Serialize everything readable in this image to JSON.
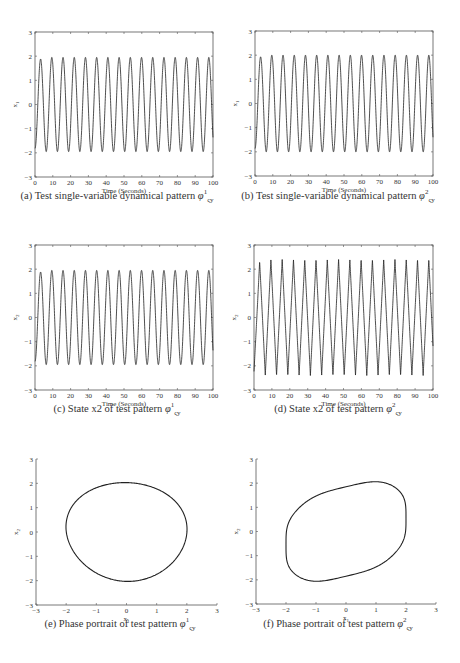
{
  "figure": {
    "panels": [
      {
        "id": "a",
        "caption_prefix": "(a) Test single-variable dynamical pattern ",
        "caption_symbol": "φ",
        "caption_sup": "1",
        "caption_sub": "ς",
        "caption_subsub": "y",
        "xlabel": "Time (Seconds)",
        "ylabel": "x1"
      },
      {
        "id": "b",
        "caption_prefix": "(b) Test single-variable dynamical pattern ",
        "caption_symbol": "φ",
        "caption_sup": "2",
        "caption_sub": "ς",
        "caption_subsub": "y",
        "xlabel": "Time (Seconds)",
        "ylabel": "x1"
      },
      {
        "id": "c",
        "caption_prefix": "(c) State x2 of test pattern ",
        "caption_symbol": "φ",
        "caption_sup": "1",
        "caption_sub": "ς",
        "caption_subsub": "y",
        "xlabel": "Time (Seconds)",
        "ylabel": "x2"
      },
      {
        "id": "d",
        "caption_prefix": "(d) State x2 of test pattern ",
        "caption_symbol": "φ",
        "caption_sup": "2",
        "caption_sub": "ς",
        "caption_subsub": "y",
        "xlabel": "Time (Seconds)",
        "ylabel": "x2"
      },
      {
        "id": "e",
        "caption_prefix": "(e) Phase portrait of test pattern ",
        "caption_symbol": "φ",
        "caption_sup": "1",
        "caption_sub": "ς",
        "caption_subsub": "y",
        "xlabel": "x1",
        "ylabel": "x2"
      },
      {
        "id": "f",
        "caption_prefix": "(f) Phase portrait of test pattern ",
        "caption_symbol": "φ",
        "caption_sup": "2",
        "caption_sub": "ς",
        "caption_subsub": "y",
        "xlabel": "x1",
        "ylabel": "x2"
      }
    ]
  },
  "chart_data": [
    {
      "type": "line",
      "title": "(a) Test single-variable dynamical pattern φ¹ςy",
      "xlabel": "Time (Seconds)",
      "ylabel": "x1",
      "xlim": [
        0,
        100
      ],
      "ylim": [
        -3,
        3
      ],
      "xticks": [
        0,
        10,
        20,
        30,
        40,
        50,
        60,
        70,
        80,
        90,
        100
      ],
      "yticks": [
        -3,
        -2,
        -1,
        0,
        1,
        2,
        3
      ],
      "series": [
        {
          "name": "x1",
          "description": "sinusoid-like oscillation",
          "amplitude": 1.95,
          "period": 6.3,
          "cycles_shown": 16,
          "shape": "sine"
        }
      ],
      "grid": false
    },
    {
      "type": "line",
      "title": "(b) Test single-variable dynamical pattern φ²ςy",
      "xlabel": "Time (Seconds)",
      "ylabel": "x1",
      "xlim": [
        0,
        100
      ],
      "ylim": [
        -3,
        3
      ],
      "xticks": [
        0,
        10,
        20,
        30,
        40,
        50,
        60,
        70,
        80,
        90,
        100
      ],
      "yticks": [
        -3,
        -2,
        -1,
        0,
        1,
        2,
        3
      ],
      "series": [
        {
          "name": "x1",
          "description": "sinusoid-like oscillation",
          "amplitude": 2.0,
          "period": 6.3,
          "cycles_shown": 16,
          "shape": "sine"
        }
      ],
      "grid": false
    },
    {
      "type": "line",
      "title": "(c) State x2 of test pattern φ¹ςy",
      "xlabel": "Time (Seconds)",
      "ylabel": "x2",
      "xlim": [
        0,
        100
      ],
      "ylim": [
        -3,
        3
      ],
      "xticks": [
        0,
        10,
        20,
        30,
        40,
        50,
        60,
        70,
        80,
        90,
        100
      ],
      "yticks": [
        -3,
        -2,
        -1,
        0,
        1,
        2,
        3
      ],
      "series": [
        {
          "name": "x2",
          "description": "sinusoid-like oscillation",
          "amplitude": 1.95,
          "period": 6.3,
          "cycles_shown": 16,
          "shape": "sine"
        }
      ],
      "grid": false
    },
    {
      "type": "line",
      "title": "(d) State x2 of test pattern φ²ςy",
      "xlabel": "Time (Seconds)",
      "ylabel": "x2",
      "xlim": [
        0,
        100
      ],
      "ylim": [
        -3,
        3
      ],
      "xticks": [
        0,
        10,
        20,
        30,
        40,
        50,
        60,
        70,
        80,
        90,
        100
      ],
      "yticks": [
        -3,
        -2,
        -1,
        0,
        1,
        2,
        3
      ],
      "series": [
        {
          "name": "x2",
          "description": "sawtooth-like oscillation with sharp peaks",
          "amplitude": 2.4,
          "period": 6.3,
          "cycles_shown": 16,
          "shape": "sharp"
        }
      ],
      "grid": false
    },
    {
      "type": "line",
      "title": "(e) Phase portrait of test pattern φ¹ςy",
      "xlabel": "x1",
      "ylabel": "x2",
      "xlim": [
        -3,
        3
      ],
      "ylim": [
        -3,
        3
      ],
      "xticks": [
        -3,
        -2,
        -1,
        0,
        1,
        2,
        3
      ],
      "yticks": [
        -3,
        -2,
        -1,
        0,
        1,
        2,
        3
      ],
      "series": [
        {
          "name": "limit cycle",
          "description": "near-circular closed orbit",
          "x_range": [
            -2.0,
            2.0
          ],
          "y_range": [
            -2.05,
            2.03
          ],
          "shape": "ellipse"
        }
      ],
      "grid": false
    },
    {
      "type": "line",
      "title": "(f) Phase portrait of test pattern φ²ςy",
      "xlabel": "x1",
      "ylabel": "x2",
      "xlim": [
        -3,
        3
      ],
      "ylim": [
        -3,
        3
      ],
      "xticks": [
        -3,
        -2,
        -1,
        0,
        1,
        2,
        3
      ],
      "yticks": [
        -3,
        -2,
        -1,
        0,
        1,
        2,
        3
      ],
      "series": [
        {
          "name": "limit cycle",
          "description": "skewed rounded-parallelogram orbit",
          "x_range": [
            -2.0,
            2.0
          ],
          "y_range": [
            -2.42,
            2.4
          ],
          "peak_at_x1": 0.8,
          "trough_at_x1": -0.75,
          "shape": "skewed"
        }
      ],
      "grid": false
    }
  ],
  "layout": {
    "boxes": [
      {
        "l": 35,
        "t": 32,
        "r": 213,
        "b": 177,
        "cap_y": 196,
        "cap_x": 117
      },
      {
        "l": 255,
        "t": 31,
        "r": 433,
        "b": 176,
        "cap_y": 196,
        "cap_x": 338
      },
      {
        "l": 35,
        "t": 245,
        "r": 213,
        "b": 390,
        "cap_y": 409,
        "cap_x": 117
      },
      {
        "l": 254,
        "t": 245,
        "r": 433,
        "b": 390,
        "cap_y": 409,
        "cap_x": 338
      },
      {
        "l": 36,
        "t": 459,
        "r": 217,
        "b": 605,
        "cap_y": 624,
        "cap_x": 120
      },
      {
        "l": 256,
        "t": 459,
        "r": 436,
        "b": 604,
        "cap_y": 624,
        "cap_x": 338
      }
    ]
  }
}
